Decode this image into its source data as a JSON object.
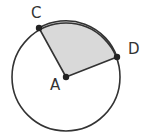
{
  "diagram": {
    "type": "circle-sector",
    "center": {
      "label": "A",
      "x": 66,
      "y": 77
    },
    "radius": 54,
    "points": [
      {
        "label": "C",
        "x": 39,
        "y": 28
      },
      {
        "label": "D",
        "x": 117,
        "y": 57
      }
    ],
    "shaded_region": "sector CAD",
    "colors": {
      "stroke": "#333333",
      "shade": "#d9d9d9",
      "background": "#ffffff"
    }
  }
}
